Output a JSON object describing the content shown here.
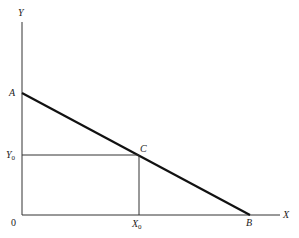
{
  "diagram": {
    "type": "line-diagram",
    "axes": {
      "x_label": "X",
      "y_label": "Y",
      "origin_label": "0"
    },
    "points": {
      "A": {
        "label": "A",
        "x": 0,
        "y": 1.0
      },
      "B": {
        "label": "B",
        "x": 1.0,
        "y": 0
      },
      "C": {
        "label": "C",
        "x": 0.5,
        "y": 0.5
      }
    },
    "projections": {
      "x0": {
        "label": "X",
        "subscript": "0"
      },
      "y0": {
        "label": "Y",
        "subscript": "0"
      }
    }
  }
}
